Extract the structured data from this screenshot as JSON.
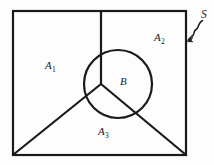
{
  "figure": {
    "background_color": "#fdfdfd",
    "stroke_color": "#1a1a1a",
    "stroke_width": 2,
    "labels": {
      "sample_space": "S",
      "region_1_base": "A",
      "region_1_sub": "1",
      "region_2_base": "A",
      "region_2_sub": "2",
      "region_3_base": "A",
      "region_3_sub": "3",
      "event_b": "B"
    },
    "geometry": {
      "rect": {
        "x": 13,
        "y": 11,
        "width": 173,
        "height": 144
      },
      "partition_center": {
        "x": 101,
        "y": 84
      },
      "vertical_edge_top": {
        "x": 101,
        "y": 11
      },
      "left_diagonal_end": {
        "x": 13,
        "y": 155
      },
      "right_diagonal_end": {
        "x": 186,
        "y": 155
      },
      "circle": {
        "cx": 118,
        "cy": 84,
        "r": 34
      },
      "leader_arrow_tip": {
        "x": 187,
        "y": 41
      },
      "leader_start": {
        "x": 202,
        "y": 21
      }
    }
  }
}
